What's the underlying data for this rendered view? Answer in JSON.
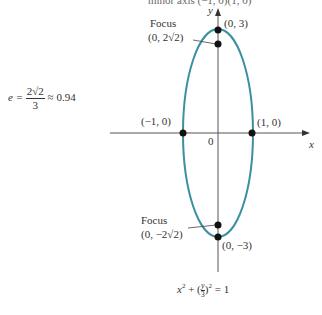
{
  "cut_text": "minor axis (−1, 0)(1, 0)",
  "axes": {
    "x_label": "x",
    "y_label": "y",
    "origin_label": "0"
  },
  "eccentricity": {
    "lhs": "e =",
    "numerator": "2√2",
    "denominator": "3",
    "approx": "≈ 0.94"
  },
  "points": {
    "top_vertex": "(0, 3)",
    "bottom_vertex": "(0, −3)",
    "left_vertex": "(−1, 0)",
    "right_vertex": "(1, 0)"
  },
  "foci": {
    "top": {
      "title": "Focus",
      "coords": "(0, 2√2)"
    },
    "bottom": {
      "title": "Focus",
      "coords": "(0, −2√2)"
    }
  },
  "equation": {
    "part1": "x",
    "sup1": "2",
    "plus": " + (",
    "frac_num": "y",
    "frac_den": "3",
    "close": ")",
    "sup2": "2",
    "rhs": " = 1"
  },
  "colors": {
    "ellipse": "#3a8fa0",
    "axis": "#555555",
    "point": "#111111"
  }
}
